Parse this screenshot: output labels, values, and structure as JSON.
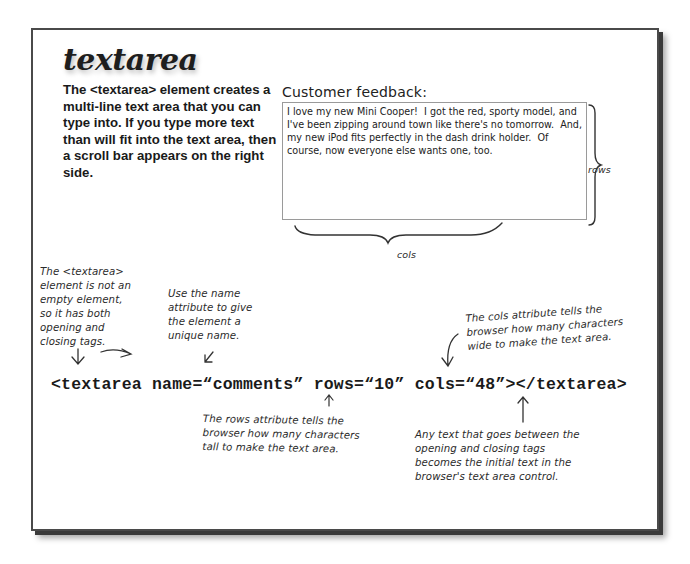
{
  "page": {
    "title": "textarea",
    "intro": "The <textarea> element creates a multi-line text area that you can type into.  If you type more text than will fit into the text area, then a scroll bar appears on the right side."
  },
  "example": {
    "label": "Customer feedback:",
    "textarea_value": "I love my new Mini Cooper!  I got the red, sporty model, and I've been zipping around town like there's no tomorrow.  And, my new iPod fits perfectly in the dash drink holder.  Of course, now everyone else wants one, too.",
    "rows_label": "rows",
    "cols_label": "cols"
  },
  "annotations": {
    "not_empty": "The <textarea> element is not an empty element, so it has both opening and closing tags.",
    "name_attr": "Use the name attribute to give the element a unique name.",
    "cols_attr": "The cols attribute tells the browser how many characters wide to make the text area.",
    "rows_attr": "The rows attribute tells the browser how many characters tall to make the text area.",
    "initial_text": "Any text that goes between the opening and closing tags becomes the initial text in the browser's text area control."
  },
  "code": {
    "line": "<textarea name=“comments” rows=“10” cols=“48”></textarea>"
  },
  "colors": {
    "frame_border": "#4a4a4a",
    "text": "#1a1a1a",
    "textarea_border": "#9a9a9a"
  }
}
